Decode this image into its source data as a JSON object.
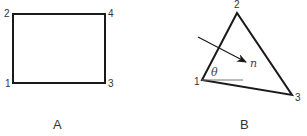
{
  "panels": [
    {
      "caption": "A",
      "shape": "rectangle",
      "nodes": [
        {
          "label": "1",
          "position": "bottom-left"
        },
        {
          "label": "2",
          "position": "top-left"
        },
        {
          "label": "3",
          "position": "bottom-right"
        },
        {
          "label": "4",
          "position": "top-right"
        }
      ]
    },
    {
      "caption": "B",
      "shape": "triangle",
      "nodes": [
        {
          "label": "1",
          "position": "left"
        },
        {
          "label": "2",
          "position": "top"
        },
        {
          "label": "3",
          "position": "bottom-right"
        }
      ],
      "normal_label": "n",
      "angle_label": "θ"
    }
  ],
  "colors": {
    "stroke": "#1a1a1a",
    "reference_line": "#777777"
  }
}
